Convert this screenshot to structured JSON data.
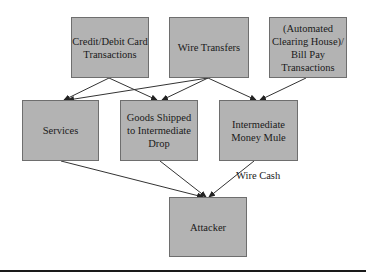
{
  "diagram": {
    "nodes": [
      {
        "id": "credit",
        "label": "Credit/Debit Card\nTransactions"
      },
      {
        "id": "wire",
        "label": "Wire Transfers"
      },
      {
        "id": "ach",
        "label": "(Automated\nClearing House)/\nBill Pay\nTransactions"
      },
      {
        "id": "services",
        "label": "Services"
      },
      {
        "id": "goods",
        "label": "Goods Shipped\nto Intermediate\nDrop"
      },
      {
        "id": "mule",
        "label": "Intermediate\nMoney Mule"
      },
      {
        "id": "attacker",
        "label": "Attacker"
      }
    ],
    "edges": [
      {
        "from": "credit",
        "to": "services"
      },
      {
        "from": "credit",
        "to": "goods"
      },
      {
        "from": "wire",
        "to": "services"
      },
      {
        "from": "wire",
        "to": "goods"
      },
      {
        "from": "wire",
        "to": "mule"
      },
      {
        "from": "ach",
        "to": "mule"
      },
      {
        "from": "services",
        "to": "attacker"
      },
      {
        "from": "goods",
        "to": "attacker"
      },
      {
        "from": "mule",
        "to": "attacker",
        "label": "Wire Cash"
      }
    ],
    "edge_label_wire_cash": "Wire Cash",
    "colors": {
      "box_fill": "#b3b3b3",
      "box_border": "#6e6e6e",
      "line": "#333333",
      "rule": "#1a1a1a"
    }
  }
}
